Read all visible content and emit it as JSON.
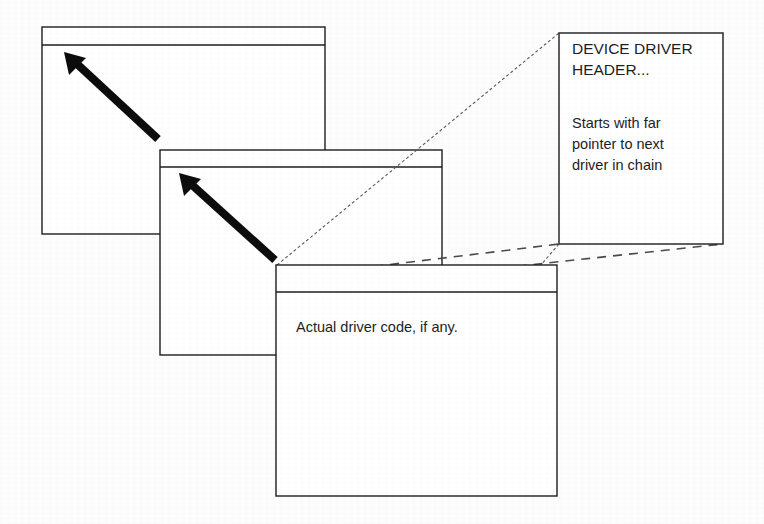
{
  "diagram": {
    "background_color": "#fdfdfd",
    "ink_color": "#1d1d1d",
    "leader_color": "#4a4a4a",
    "arrow_color": "#0c0c0c"
  },
  "driver_blocks": [
    {
      "id": "driver-block-back",
      "name": "back-driver-block",
      "x": 42,
      "y": 27,
      "width": 283,
      "height": 207,
      "header_height": 18,
      "label": ""
    },
    {
      "id": "driver-block-middle",
      "name": "middle-driver-block",
      "x": 160,
      "y": 150,
      "width": 282,
      "height": 205,
      "header_height": 17,
      "label": ""
    },
    {
      "id": "driver-block-front",
      "name": "front-driver-block",
      "x": 276,
      "y": 265,
      "width": 281,
      "height": 231,
      "header_height": 27,
      "label": "Actual driver code, if any."
    }
  ],
  "chain_arrows": [
    {
      "name": "chain-arrow-upper",
      "from_x": 158,
      "from_y": 139,
      "to_x": 68,
      "to_y": 56
    },
    {
      "name": "chain-arrow-lower",
      "from_x": 275,
      "from_y": 260,
      "to_x": 183,
      "to_y": 177
    }
  ],
  "callout": {
    "x": 559,
    "y": 33,
    "width": 164,
    "height": 211,
    "title": "DEVICE DRIVER\nHEADER...",
    "body": "Starts with far\npointer to next\ndriver in chain",
    "leaders": [
      {
        "name": "callout-leader-top",
        "x1": 277,
        "y1": 265,
        "x2": 559,
        "y2": 33
      },
      {
        "name": "callout-leader-bottom",
        "x1": 279,
        "y1": 292,
        "x2": 723,
        "y2": 244
      }
    ]
  }
}
